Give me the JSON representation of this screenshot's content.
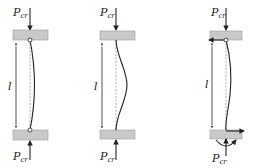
{
  "figure": {
    "type": "column-buckling-diagram",
    "columns": [
      {
        "id": "pinned-pinned",
        "top_load_label": {
          "main": "P",
          "sub": "cr"
        },
        "bottom_load_label": {
          "main": "P",
          "sub": "cr"
        },
        "length_label": "l",
        "top_support": "pin",
        "bottom_support": "pin",
        "mode_shape": "half-sine"
      },
      {
        "id": "fixed-fixed",
        "top_load_label": {
          "main": "P",
          "sub": "cr"
        },
        "bottom_load_label": {
          "main": "P",
          "sub": "cr"
        },
        "length_label": "l",
        "top_support": "fixed",
        "bottom_support": "fixed",
        "mode_shape": "full-sine"
      },
      {
        "id": "pinned-fixed",
        "top_load_label": {
          "main": "P",
          "sub": "cr"
        },
        "bottom_load_label": {
          "main": "P",
          "sub": "cr"
        },
        "length_label": "l",
        "top_support": "pin",
        "bottom_support": "fixed-with-moment",
        "mode_shape": "propped"
      }
    ]
  },
  "colors": {
    "plate": "#c9c9c9",
    "line": "#222222",
    "dimension": "#555555"
  }
}
